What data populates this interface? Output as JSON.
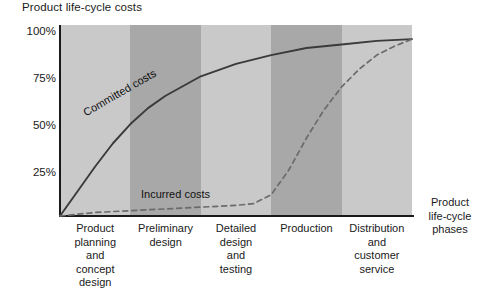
{
  "chart_data": {
    "type": "line",
    "title": "Product life-cycle costs",
    "xlabel": "Product life-cycle phases",
    "ylabel": "",
    "grid": false,
    "legend": "inline-annotations",
    "ylim": [
      0,
      108
    ],
    "yticks": [
      25,
      50,
      75,
      100
    ],
    "ytick_labels": [
      "25%",
      "50%",
      "75%",
      "100%"
    ],
    "categories": [
      "Product planning and concept design",
      "Preliminary design",
      "Detailed design and testing",
      "Production",
      "Distribution and customer service"
    ],
    "category_lines": [
      [
        "Product",
        "planning",
        "and",
        "concept",
        "design"
      ],
      [
        "Preliminary",
        "design"
      ],
      [
        "Detailed",
        "design",
        "and",
        "testing"
      ],
      [
        "Production"
      ],
      [
        "Distribution",
        "and",
        "customer",
        "service"
      ]
    ],
    "band_colors": [
      "#c9c9c9",
      "#a8a8a8",
      "#c9c9c9",
      "#a8a8a8",
      "#c9c9c9"
    ],
    "series": [
      {
        "name": "Committed costs",
        "style": "solid",
        "color": "#3a3a3a",
        "x": [
          0,
          5,
          10,
          15,
          20,
          25,
          30,
          40,
          50,
          60,
          70,
          80,
          90,
          100
        ],
        "values": [
          0,
          14,
          28,
          41,
          52,
          61,
          68,
          79,
          86,
          91,
          95,
          97,
          99,
          100
        ]
      },
      {
        "name": "Incurred costs",
        "style": "dashed",
        "color": "#6b6b6b",
        "x": [
          0,
          10,
          20,
          30,
          40,
          50,
          55,
          60,
          65,
          70,
          75,
          80,
          85,
          90,
          95,
          100
        ],
        "values": [
          0,
          2,
          3,
          4,
          5,
          6,
          7,
          12,
          26,
          44,
          60,
          73,
          83,
          91,
          96,
          100
        ]
      }
    ],
    "annotations": [
      {
        "text": "Committed costs",
        "rotation": -30
      },
      {
        "text": "Incurred costs",
        "rotation": 0
      }
    ]
  }
}
